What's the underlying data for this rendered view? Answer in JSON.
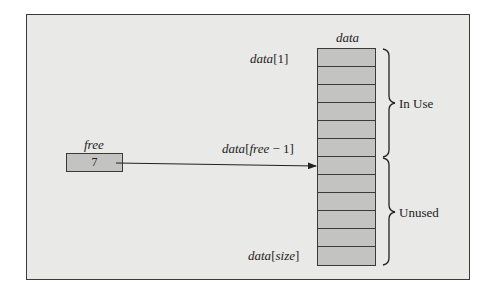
{
  "diagram": {
    "array_label": "data",
    "array_cell_count": 12,
    "index_labels": {
      "first": {
        "name": "data",
        "index": "[1]"
      },
      "free_pointer": {
        "name": "data",
        "open": "[",
        "var": "free",
        "op": " − 1]"
      },
      "last": {
        "name": "data",
        "open": "[",
        "var": "size",
        "close": "]"
      }
    },
    "free_variable": {
      "label": "free",
      "value": "7"
    },
    "regions": [
      {
        "label": "In Use",
        "from_cell": 1,
        "to_cell": 6
      },
      {
        "label": "Unused",
        "from_cell": 7,
        "to_cell": 12
      }
    ],
    "arrow": {
      "from": "free",
      "to_cell": 7
    },
    "colors": {
      "background": "#e9e9e7",
      "cell_fill": "#c3c3c1",
      "stroke": "#3a3a3a"
    }
  }
}
